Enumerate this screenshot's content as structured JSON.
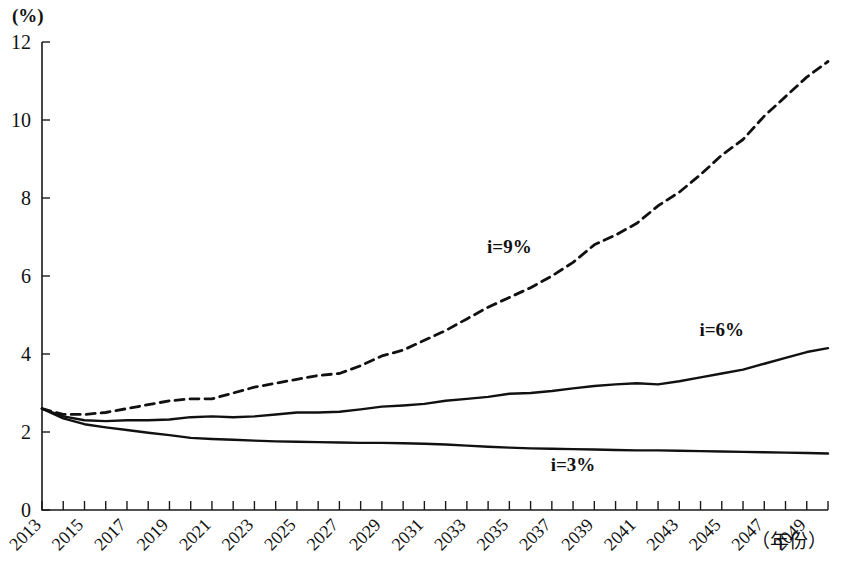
{
  "chart_data": {
    "type": "line",
    "title": "",
    "xlabel": "（年份）",
    "ylabel": "(%)",
    "ylim": [
      0,
      12
    ],
    "xlim": [
      2013,
      2050
    ],
    "y_ticks": [
      "0",
      "2",
      "4",
      "6",
      "8",
      "10",
      "12"
    ],
    "y_tick_values": [
      0,
      2,
      4,
      6,
      8,
      10,
      12
    ],
    "grid": false,
    "legend_position": "inline-annotations",
    "x": [
      2013,
      2014,
      2015,
      2016,
      2017,
      2018,
      2019,
      2020,
      2021,
      2022,
      2023,
      2024,
      2025,
      2026,
      2027,
      2028,
      2029,
      2030,
      2031,
      2032,
      2033,
      2034,
      2035,
      2036,
      2037,
      2038,
      2039,
      2040,
      2041,
      2042,
      2043,
      2044,
      2045,
      2046,
      2047,
      2048,
      2049,
      2050
    ],
    "x_tick_labels": [
      "2013",
      "2015",
      "2017",
      "2019",
      "2021",
      "2023",
      "2025",
      "2027",
      "2029",
      "2031",
      "2033",
      "2035",
      "2037",
      "2039",
      "2041",
      "2043",
      "2045",
      "2047",
      "2049"
    ],
    "x_tick_values": [
      2013,
      2015,
      2017,
      2019,
      2021,
      2023,
      2025,
      2027,
      2029,
      2031,
      2033,
      2035,
      2037,
      2039,
      2041,
      2043,
      2045,
      2047,
      2049
    ],
    "series": [
      {
        "name": "i=9%",
        "label": "i=9%",
        "style": "dashed",
        "color": "#111111",
        "label_x": 2035,
        "label_y": 6.6,
        "values": [
          2.6,
          2.45,
          2.45,
          2.5,
          2.6,
          2.7,
          2.8,
          2.85,
          2.85,
          3.0,
          3.15,
          3.25,
          3.35,
          3.45,
          3.5,
          3.7,
          3.95,
          4.1,
          4.35,
          4.6,
          4.9,
          5.2,
          5.45,
          5.7,
          6.0,
          6.35,
          6.8,
          7.05,
          7.35,
          7.8,
          8.15,
          8.6,
          9.1,
          9.5,
          10.1,
          10.6,
          11.1,
          11.5
        ]
      },
      {
        "name": "i=6%",
        "label": "i=6%",
        "style": "solid",
        "color": "#111111",
        "label_x": 2045,
        "label_y": 4.45,
        "values": [
          2.6,
          2.4,
          2.3,
          2.28,
          2.3,
          2.3,
          2.32,
          2.38,
          2.4,
          2.38,
          2.4,
          2.45,
          2.5,
          2.5,
          2.52,
          2.58,
          2.65,
          2.68,
          2.72,
          2.8,
          2.85,
          2.9,
          2.98,
          3.0,
          3.05,
          3.12,
          3.18,
          3.22,
          3.25,
          3.22,
          3.3,
          3.4,
          3.5,
          3.6,
          3.75,
          3.9,
          4.05,
          4.15
        ]
      },
      {
        "name": "i=3%",
        "label": "i=3%",
        "style": "solid",
        "color": "#111111",
        "label_x": 2038,
        "label_y": 1.0,
        "values": [
          2.6,
          2.35,
          2.2,
          2.12,
          2.05,
          1.98,
          1.92,
          1.85,
          1.82,
          1.8,
          1.78,
          1.76,
          1.75,
          1.74,
          1.73,
          1.72,
          1.72,
          1.71,
          1.7,
          1.68,
          1.65,
          1.62,
          1.6,
          1.58,
          1.57,
          1.56,
          1.55,
          1.54,
          1.53,
          1.53,
          1.52,
          1.51,
          1.5,
          1.49,
          1.48,
          1.47,
          1.46,
          1.45
        ]
      }
    ]
  }
}
